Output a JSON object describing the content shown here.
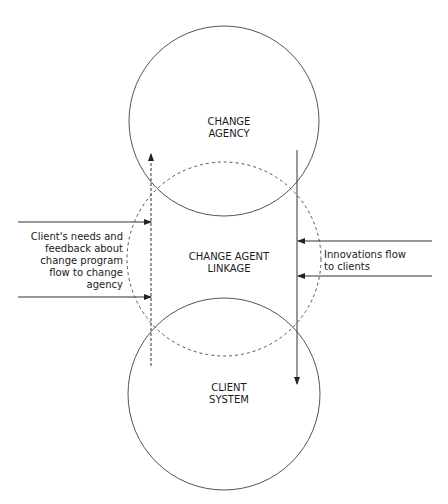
{
  "diagram": {
    "colors": {
      "stroke": "#555555",
      "text": "#1a1a1a",
      "background": "#ffffff"
    },
    "nodes": {
      "change_agency": {
        "line1": "CHANGE",
        "line2": "AGENCY"
      },
      "linkage": {
        "line1": "CHANGE AGENT",
        "line2": "LINKAGE"
      },
      "client_system": {
        "line1": "CLIENT",
        "line2": "SYSTEM"
      }
    },
    "flows": {
      "client_feedback": {
        "lines": [
          "Client's needs and",
          "feedback about",
          "change program",
          "flow to change",
          "agency"
        ],
        "direction": "up"
      },
      "innovations": {
        "lines": [
          "Innovations flow",
          "to clients"
        ],
        "direction": "down"
      }
    }
  }
}
